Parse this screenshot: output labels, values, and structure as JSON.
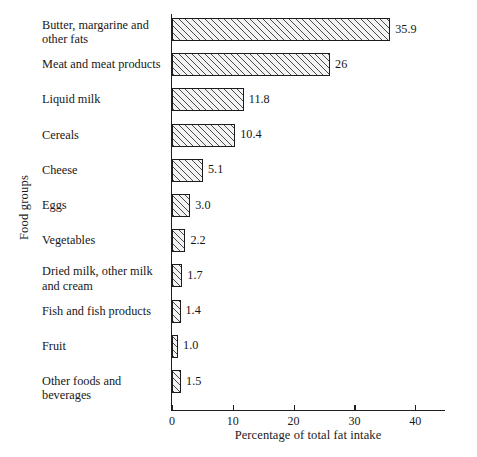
{
  "chart_data": {
    "type": "bar",
    "orientation": "horizontal",
    "title": "",
    "xlabel": "Percentage of total fat intake",
    "ylabel": "Food groups",
    "xlim": [
      0,
      45
    ],
    "xticks": [
      0,
      10,
      20,
      30,
      40
    ],
    "xtick_labels": [
      "0",
      "10",
      "20",
      "30",
      "40"
    ],
    "grid": false,
    "legend": false,
    "categories": [
      "Butter, margarine and other fats",
      "Meat and meat products",
      "Liquid milk",
      "Cereals",
      "Cheese",
      "Eggs",
      "Vegetables",
      "Dried milk, other milk and cream",
      "Fish and fish products",
      "Fruit",
      "Other foods and beverages"
    ],
    "values": [
      35.9,
      26,
      11.8,
      10.4,
      5.1,
      3.0,
      2.2,
      1.7,
      1.4,
      1.0,
      1.5
    ],
    "value_labels": [
      "35.9",
      "26",
      "11.8",
      "10.4",
      "5.1",
      "3.0",
      "2.2",
      "1.7",
      "1.4",
      "1.0",
      "1.5"
    ]
  },
  "rows": [
    {
      "label_line1": "Butter, margarine and",
      "label_line2": "other fats",
      "value_label": "35.9",
      "value": 35.9
    },
    {
      "label_line1": "Meat and meat products",
      "label_line2": "",
      "value_label": "26",
      "value": 26
    },
    {
      "label_line1": "Liquid milk",
      "label_line2": "",
      "value_label": "11.8",
      "value": 11.8
    },
    {
      "label_line1": "Cereals",
      "label_line2": "",
      "value_label": "10.4",
      "value": 10.4
    },
    {
      "label_line1": "Cheese",
      "label_line2": "",
      "value_label": "5.1",
      "value": 5.1
    },
    {
      "label_line1": "Eggs",
      "label_line2": "",
      "value_label": "3.0",
      "value": 3.0
    },
    {
      "label_line1": "Vegetables",
      "label_line2": "",
      "value_label": "2.2",
      "value": 2.2
    },
    {
      "label_line1": "Dried milk, other milk",
      "label_line2": "and cream",
      "value_label": "1.7",
      "value": 1.7
    },
    {
      "label_line1": "Fish and fish products",
      "label_line2": "",
      "value_label": "1.4",
      "value": 1.4
    },
    {
      "label_line1": "Fruit",
      "label_line2": "",
      "value_label": "1.0",
      "value": 1.0
    },
    {
      "label_line1": "Other foods and beverages",
      "label_line2": "",
      "value_label": "1.5",
      "value": 1.5
    }
  ],
  "axes": {
    "x_title": "Percentage of total fat intake",
    "y_title": "Food groups",
    "x_tick_labels": [
      "0",
      "10",
      "20",
      "30",
      "40"
    ]
  },
  "style": {
    "background": "#ffffff",
    "ink": "#1a1a1a",
    "bar_fill": "#f3f3f3",
    "bar_edge": "#1b1b1b",
    "hatch": "#4a4a4a"
  }
}
